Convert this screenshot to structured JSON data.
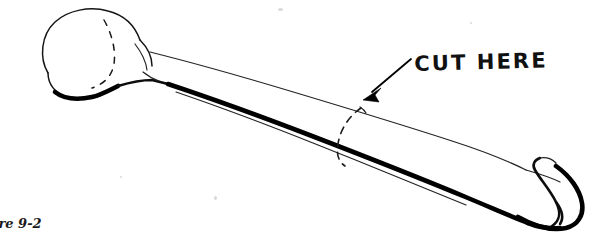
{
  "figure": {
    "caption": "ure 9-2",
    "caption_full_implied": "Figure 9-2",
    "background_color": "#ffffff",
    "ink_color": "#000000",
    "width_px": 602,
    "height_px": 233
  },
  "annotations": {
    "cut_here_label": "CUT HERE",
    "cut_line_style": "dashed",
    "arrow": {
      "from_x": 410,
      "from_y": 60,
      "to_x": 364,
      "to_y": 99,
      "head": "solid-triangle"
    }
  },
  "drawing": {
    "proximal_end_label": "rounded epiphysis (left)",
    "shaft_label": "diaphysis",
    "distal_end_label": "hooked epiphysis (right)",
    "orientation": "upper-left to lower-right diagonal"
  }
}
